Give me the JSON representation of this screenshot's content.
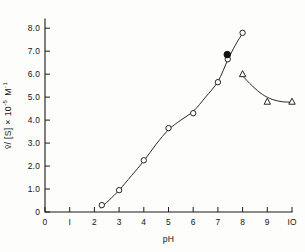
{
  "chart_data": {
    "type": "scatter",
    "title": "",
    "xlabel": "pH",
    "ylabel": "v̄/[S] × 10⁻⁵ M⁻¹",
    "ylabel_parts": {
      "main": "v̄/ [S]",
      "times": "×",
      "base": "10",
      "exponent": "-5",
      "unit": "M",
      "unit_exponent": "-1"
    },
    "xlim": [
      0,
      10
    ],
    "ylim": [
      0,
      8.4
    ],
    "xticks": [
      0,
      1,
      2,
      3,
      4,
      5,
      6,
      7,
      8,
      9,
      10
    ],
    "xticklabels": [
      "0",
      "I",
      "2",
      "3",
      "4",
      "5",
      "6",
      "7",
      "8",
      "9",
      "IO"
    ],
    "yticks": [
      0,
      1.0,
      2.0,
      3.0,
      4.0,
      5.0,
      6.0,
      7.0,
      8.0
    ],
    "yticklabels": [
      "0",
      "1.0",
      "2.0",
      "3.0",
      "4.0",
      "5.0",
      "6.0",
      "7.0",
      "8.0"
    ],
    "grid": false,
    "legend": "none",
    "series": [
      {
        "name": "open-circles-ascending",
        "marker": "open-circle",
        "color": "#1a1a1a",
        "points": [
          {
            "x": 2.3,
            "y": 0.3
          },
          {
            "x": 3.0,
            "y": 0.95
          },
          {
            "x": 4.0,
            "y": 2.25
          },
          {
            "x": 5.0,
            "y": 3.65
          },
          {
            "x": 6.0,
            "y": 4.3
          },
          {
            "x": 7.0,
            "y": 5.65
          },
          {
            "x": 7.4,
            "y": 6.65
          },
          {
            "x": 8.0,
            "y": 7.8
          }
        ]
      },
      {
        "name": "filled-circle",
        "marker": "filled-circle",
        "color": "#111111",
        "points": [
          {
            "x": 7.38,
            "y": 6.85
          }
        ]
      },
      {
        "name": "open-triangles-descending",
        "marker": "open-triangle",
        "color": "#1a1a1a",
        "points": [
          {
            "x": 8.0,
            "y": 6.0
          },
          {
            "x": 9.0,
            "y": 4.8
          },
          {
            "x": 10.0,
            "y": 4.8
          }
        ]
      }
    ],
    "curves": [
      {
        "name": "ascending-curve",
        "path_points": [
          {
            "x": 2.25,
            "y": 0.18
          },
          {
            "x": 2.6,
            "y": 0.52
          },
          {
            "x": 3.0,
            "y": 0.95
          },
          {
            "x": 3.5,
            "y": 1.58
          },
          {
            "x": 4.0,
            "y": 2.22
          },
          {
            "x": 4.5,
            "y": 2.95
          },
          {
            "x": 5.0,
            "y": 3.58
          },
          {
            "x": 5.5,
            "y": 4.0
          },
          {
            "x": 6.0,
            "y": 4.38
          },
          {
            "x": 6.5,
            "y": 5.0
          },
          {
            "x": 7.0,
            "y": 5.68
          },
          {
            "x": 7.4,
            "y": 6.62
          },
          {
            "x": 7.7,
            "y": 7.25
          },
          {
            "x": 8.0,
            "y": 7.78
          }
        ]
      },
      {
        "name": "descending-curve",
        "path_points": [
          {
            "x": 8.0,
            "y": 5.92
          },
          {
            "x": 8.4,
            "y": 5.48
          },
          {
            "x": 8.8,
            "y": 5.12
          },
          {
            "x": 9.2,
            "y": 4.9
          },
          {
            "x": 9.6,
            "y": 4.8
          },
          {
            "x": 10.0,
            "y": 4.78
          }
        ]
      }
    ]
  }
}
